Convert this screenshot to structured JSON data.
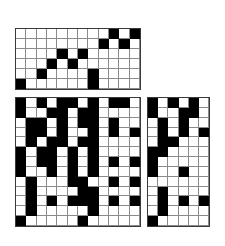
{
  "figure": {
    "kind": "binary-matrix-figure",
    "background_color": "#ffffff",
    "on_color": "#000000",
    "off_color": "#ffffff",
    "gridline_color": "#8a8a8a",
    "border_color": "#3a3a3a"
  },
  "grids": [
    {
      "name": "top-grid",
      "rows": 6,
      "cols": 12,
      "x": 15,
      "y": 28,
      "width": 126,
      "height": 62,
      "matrix": [
        [
          0,
          0,
          0,
          0,
          0,
          0,
          0,
          0,
          0,
          1,
          0,
          1
        ],
        [
          0,
          0,
          0,
          0,
          0,
          0,
          0,
          0,
          1,
          0,
          1,
          0
        ],
        [
          0,
          0,
          0,
          0,
          1,
          0,
          1,
          0,
          0,
          0,
          0,
          0
        ],
        [
          0,
          0,
          0,
          1,
          0,
          1,
          0,
          0,
          0,
          0,
          0,
          0
        ],
        [
          0,
          0,
          1,
          0,
          0,
          0,
          0,
          1,
          0,
          0,
          0,
          0
        ],
        [
          1,
          0,
          0,
          0,
          0,
          0,
          0,
          1,
          0,
          0,
          0,
          0
        ]
      ]
    },
    {
      "name": "bottom-left-grid",
      "rows": 13,
      "cols": 12,
      "x": 15,
      "y": 97,
      "width": 126,
      "height": 130,
      "matrix": [
        [
          1,
          0,
          1,
          0,
          1,
          1,
          0,
          1,
          0,
          1,
          1,
          0
        ],
        [
          1,
          0,
          0,
          1,
          1,
          0,
          1,
          1,
          0,
          0,
          0,
          0
        ],
        [
          0,
          1,
          1,
          0,
          1,
          0,
          1,
          1,
          0,
          1,
          0,
          0
        ],
        [
          0,
          1,
          1,
          0,
          1,
          0,
          0,
          1,
          0,
          1,
          0,
          1
        ],
        [
          0,
          1,
          0,
          1,
          1,
          0,
          1,
          1,
          0,
          0,
          0,
          0
        ],
        [
          1,
          0,
          1,
          1,
          0,
          1,
          0,
          1,
          0,
          0,
          0,
          0
        ],
        [
          1,
          0,
          1,
          1,
          0,
          1,
          0,
          1,
          0,
          1,
          0,
          1
        ],
        [
          1,
          0,
          0,
          1,
          0,
          1,
          0,
          1,
          0,
          0,
          0,
          0
        ],
        [
          0,
          1,
          0,
          0,
          0,
          1,
          1,
          0,
          0,
          1,
          0,
          1
        ],
        [
          0,
          1,
          0,
          0,
          0,
          0,
          1,
          1,
          0,
          0,
          0,
          0
        ],
        [
          0,
          1,
          0,
          1,
          0,
          1,
          1,
          1,
          0,
          1,
          0,
          1
        ],
        [
          0,
          1,
          0,
          0,
          0,
          0,
          0,
          1,
          0,
          0,
          0,
          0
        ],
        [
          1,
          0,
          0,
          0,
          0,
          0,
          1,
          0,
          0,
          0,
          0,
          0
        ]
      ]
    },
    {
      "name": "bottom-right-grid",
      "rows": 13,
      "cols": 6,
      "x": 147,
      "y": 97,
      "width": 63,
      "height": 130,
      "matrix": [
        [
          1,
          0,
          1,
          0,
          1,
          0
        ],
        [
          1,
          0,
          0,
          1,
          1,
          0
        ],
        [
          0,
          1,
          0,
          1,
          0,
          0
        ],
        [
          0,
          1,
          0,
          1,
          0,
          1
        ],
        [
          0,
          1,
          1,
          0,
          0,
          0
        ],
        [
          1,
          1,
          0,
          0,
          0,
          0
        ],
        [
          1,
          0,
          0,
          0,
          0,
          0
        ],
        [
          1,
          0,
          0,
          1,
          0,
          0
        ],
        [
          0,
          0,
          0,
          0,
          0,
          0
        ],
        [
          0,
          1,
          0,
          0,
          0,
          0
        ],
        [
          0,
          1,
          0,
          1,
          0,
          1
        ],
        [
          0,
          1,
          0,
          0,
          0,
          0
        ],
        [
          1,
          0,
          0,
          0,
          0,
          0
        ]
      ]
    }
  ]
}
